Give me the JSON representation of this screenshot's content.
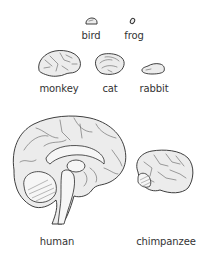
{
  "diagram": {
    "animals": [
      {
        "id": "bird",
        "label": "bird"
      },
      {
        "id": "frog",
        "label": "frog"
      },
      {
        "id": "monkey",
        "label": "monkey"
      },
      {
        "id": "cat",
        "label": "cat"
      },
      {
        "id": "rabbit",
        "label": "rabbit"
      },
      {
        "id": "human",
        "label": "human"
      },
      {
        "id": "chimpanzee",
        "label": "chimpanzee"
      }
    ],
    "colors": {
      "brain_fill": "#ececec",
      "outline": "#2a2a2a",
      "label_text": "#333333",
      "background": "#ffffff"
    }
  }
}
